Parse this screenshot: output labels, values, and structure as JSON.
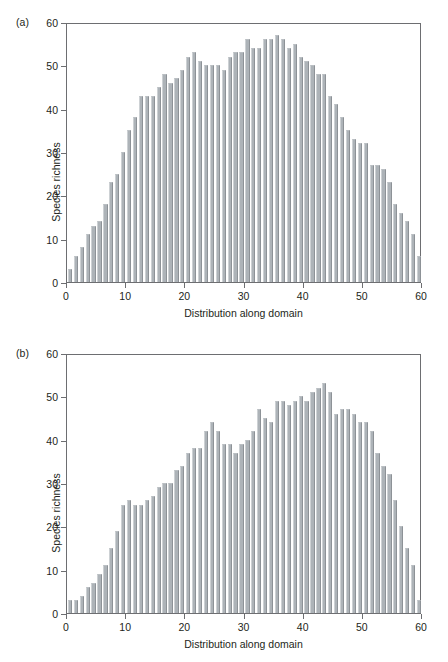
{
  "figure": {
    "background_color": "#ffffff",
    "bar_fill_color": "#adb3b8",
    "axis_color": "#6d6e71",
    "text_color": "#231f20"
  },
  "panels": [
    {
      "id": "a",
      "label": "(a)"
    },
    {
      "id": "b",
      "label": "(b)"
    }
  ],
  "chart_data": [
    {
      "type": "bar",
      "panel": "(a)",
      "title": "",
      "xlabel": "Distribution along domain",
      "ylabel": "Species richness",
      "xlim": [
        0,
        60
      ],
      "ylim": [
        0,
        60
      ],
      "xticks": [
        0,
        10,
        20,
        30,
        40,
        50,
        60
      ],
      "yticks": [
        0,
        10,
        20,
        30,
        40,
        50,
        60
      ],
      "grid": false,
      "legend": null,
      "categories": [
        1,
        2,
        3,
        4,
        5,
        6,
        7,
        8,
        9,
        10,
        11,
        12,
        13,
        14,
        15,
        16,
        17,
        18,
        19,
        20,
        21,
        22,
        23,
        24,
        25,
        26,
        27,
        28,
        29,
        30,
        31,
        32,
        33,
        34,
        35,
        36,
        37,
        38,
        39,
        40,
        41,
        42,
        43,
        44,
        45,
        46,
        47,
        48,
        49,
        50,
        51,
        52,
        53,
        54,
        55,
        56,
        57,
        58,
        59,
        60
      ],
      "values": [
        3,
        6,
        8,
        11,
        13,
        14,
        18,
        23,
        25,
        30,
        35,
        38,
        43,
        43,
        43,
        45,
        48,
        46,
        47,
        49,
        52,
        53,
        51,
        50,
        50,
        50,
        49,
        52,
        53,
        53,
        56,
        54,
        54,
        56,
        56,
        57,
        56,
        54,
        55,
        52,
        51,
        50,
        48,
        48,
        43,
        41,
        38,
        35,
        33,
        32,
        32,
        27,
        27,
        26,
        23,
        18,
        16,
        14,
        11,
        6
      ]
    },
    {
      "type": "bar",
      "panel": "(b)",
      "title": "",
      "xlabel": "Distribution along domain",
      "ylabel": "Species richness",
      "xlim": [
        0,
        60
      ],
      "ylim": [
        0,
        60
      ],
      "xticks": [
        0,
        10,
        20,
        30,
        40,
        50,
        60
      ],
      "yticks": [
        0,
        10,
        20,
        30,
        40,
        50,
        60
      ],
      "grid": false,
      "legend": null,
      "categories": [
        1,
        2,
        3,
        4,
        5,
        6,
        7,
        8,
        9,
        10,
        11,
        12,
        13,
        14,
        15,
        16,
        17,
        18,
        19,
        20,
        21,
        22,
        23,
        24,
        25,
        26,
        27,
        28,
        29,
        30,
        31,
        32,
        33,
        34,
        35,
        36,
        37,
        38,
        39,
        40,
        41,
        42,
        43,
        44,
        45,
        46,
        47,
        48,
        49,
        50,
        51,
        52,
        53,
        54,
        55,
        56,
        57,
        58,
        59,
        60
      ],
      "values": [
        3,
        3,
        4,
        6,
        7,
        9,
        11,
        15,
        19,
        25,
        26,
        25,
        25,
        26,
        27,
        29,
        30,
        30,
        33,
        34,
        37,
        38,
        38,
        42,
        44,
        42,
        39,
        39,
        37,
        39,
        40,
        42,
        47,
        45,
        44,
        49,
        49,
        48,
        49,
        50,
        49,
        51,
        52,
        53,
        51,
        46,
        47,
        47,
        46,
        44,
        44,
        42,
        37,
        34,
        32,
        26,
        20,
        15,
        11,
        3
      ]
    }
  ]
}
